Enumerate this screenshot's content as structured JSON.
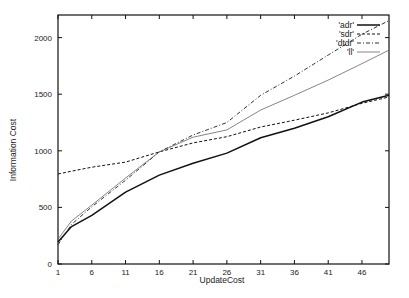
{
  "chart_data": {
    "type": "line",
    "title": "",
    "xlabel": "UpdateCost",
    "ylabel": "Information Cost",
    "xlim": [
      1,
      50
    ],
    "ylim": [
      0,
      2200
    ],
    "xticks": [
      1,
      6,
      11,
      16,
      21,
      26,
      31,
      36,
      41,
      46
    ],
    "yticks": [
      0,
      500,
      1000,
      1500,
      2000
    ],
    "grid": false,
    "legend_position": "top-right inside",
    "x": [
      1,
      3,
      6,
      11,
      16,
      21,
      26,
      31,
      36,
      41,
      46,
      50
    ],
    "series": [
      {
        "name": "'adr'",
        "style": "thick-solid",
        "color": "#111111",
        "values": [
          195,
          330,
          430,
          635,
          785,
          890,
          980,
          1115,
          1200,
          1300,
          1430,
          1490
        ]
      },
      {
        "name": "'sdr'",
        "style": "dashed",
        "color": "#111111",
        "values": [
          795,
          820,
          855,
          900,
          990,
          1070,
          1125,
          1210,
          1270,
          1335,
          1420,
          1475
        ]
      },
      {
        "name": "'dtdr'",
        "style": "dash-dot",
        "color": "#333333",
        "values": [
          170,
          350,
          505,
          740,
          990,
          1140,
          1250,
          1490,
          1660,
          1845,
          2030,
          2150
        ]
      },
      {
        "name": "'ll'",
        "style": "thin-solid",
        "color": "#666666",
        "values": [
          220,
          380,
          520,
          760,
          990,
          1120,
          1185,
          1360,
          1490,
          1625,
          1770,
          1890
        ]
      }
    ]
  }
}
